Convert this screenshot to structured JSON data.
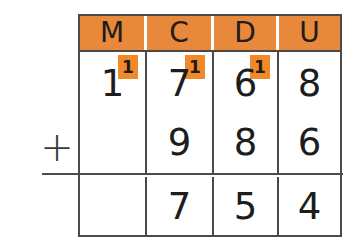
{
  "worksheet": {
    "operator": "+",
    "columns": [
      {
        "key": "m",
        "header": "M"
      },
      {
        "key": "c",
        "header": "C"
      },
      {
        "key": "d",
        "header": "D"
      },
      {
        "key": "u",
        "header": "U"
      }
    ],
    "rows": {
      "addend1": {
        "digits": [
          "1",
          "7",
          "6",
          "8"
        ],
        "carries": [
          "1",
          "1",
          "1",
          ""
        ]
      },
      "addend2": {
        "digits": [
          "",
          "9",
          "8",
          "6"
        ]
      },
      "sum": {
        "digits": [
          "",
          "7",
          "5",
          "4"
        ]
      }
    },
    "colors": {
      "header_background": "#e8883a",
      "carry_background": "#f0892a",
      "grid_line": "#4a4a4a",
      "digit": "#1d1d1d",
      "header_text": "#211c19",
      "divider_white": "#ffffff"
    }
  }
}
